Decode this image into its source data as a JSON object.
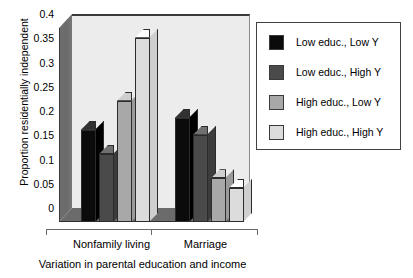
{
  "chart_data": {
    "type": "bar",
    "title": "",
    "xlabel": "Variation in parental education and income",
    "ylabel": "Proportion residentially independent",
    "categories": [
      "Nonfamily living",
      "Marriage"
    ],
    "ylim": [
      0,
      0.4
    ],
    "yticks": [
      "0.4",
      "0.35",
      "0.3",
      "0.25",
      "0.2",
      "0.15",
      "0.1",
      "0.05",
      "0"
    ],
    "ytick_values": [
      0.4,
      0.35,
      0.3,
      0.25,
      0.2,
      0.15,
      0.1,
      0.05,
      0
    ],
    "grid": false,
    "legend_position": "right",
    "three_d": true,
    "series": [
      {
        "name": "Low educ., Low Y",
        "color": "#0b0b0b",
        "values": [
          0.19,
          0.215
        ]
      },
      {
        "name": "Low educ., High Y",
        "color": "#4a4a4a",
        "values": [
          0.14,
          0.18
        ]
      },
      {
        "name": "High educ., Low Y",
        "color": "#a8a8a8",
        "values": [
          0.25,
          0.09
        ]
      },
      {
        "name": "High educ., High Y",
        "color": "#dcdcdc",
        "values": [
          0.38,
          0.07
        ]
      }
    ]
  },
  "colors": {
    "panel": "#ececec",
    "wall": "#6f6f6f",
    "floor": "#6b6b6b",
    "axis": "#6a6a6a",
    "outline": "#2b2b2b",
    "legend_border": "#404040"
  }
}
